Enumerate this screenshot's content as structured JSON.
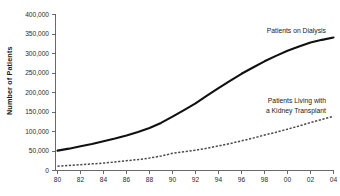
{
  "chart_data": {
    "type": "line",
    "title": "",
    "xlabel": "",
    "ylabel": "Number of Patients",
    "xlim": [
      1980,
      2004
    ],
    "ylim": [
      0,
      400000
    ],
    "grid": false,
    "legend_position": "inline-annotation",
    "x": [
      1980,
      1981,
      1982,
      1983,
      1984,
      1985,
      1986,
      1987,
      1988,
      1989,
      1990,
      1991,
      1992,
      1993,
      1994,
      1995,
      1996,
      1997,
      1998,
      1999,
      2000,
      2001,
      2002,
      2003,
      2004
    ],
    "x_tick_labels": [
      "80",
      "82",
      "84",
      "86",
      "88",
      "90",
      "92",
      "94",
      "96",
      "98",
      "00",
      "02",
      "04"
    ],
    "x_tick_values": [
      1980,
      1982,
      1984,
      1986,
      1988,
      1990,
      1992,
      1994,
      1996,
      1998,
      2000,
      2002,
      2004
    ],
    "y_tick_labels": [
      "0",
      "50,000",
      "100,000",
      "150,000",
      "200,000",
      "250,000",
      "300,000",
      "350,000",
      "400,000"
    ],
    "y_tick_values": [
      0,
      50000,
      100000,
      150000,
      200000,
      250000,
      300000,
      350000,
      400000
    ],
    "series": [
      {
        "name": "Patients on Dialysis",
        "style": "solid",
        "color": "#111111",
        "values": [
          51000,
          56000,
          62000,
          68000,
          75000,
          82000,
          90000,
          99000,
          109000,
          122000,
          138000,
          155000,
          172000,
          192000,
          211000,
          230000,
          248000,
          264000,
          280000,
          294000,
          307000,
          318000,
          328000,
          335000,
          341000
        ]
      },
      {
        "name": "Patients Living with a Kidney Transplant",
        "style": "dashed",
        "color": "#4a4a4a",
        "values": [
          11000,
          13000,
          15000,
          17000,
          19000,
          22000,
          25000,
          28000,
          32000,
          37000,
          44000,
          48000,
          52000,
          57000,
          63000,
          69000,
          76000,
          83000,
          91000,
          98000,
          106000,
          114000,
          123000,
          131000,
          139000
        ]
      }
    ],
    "annotations": [
      {
        "id": "dialysis",
        "text": "Patients on Dialysis"
      },
      {
        "id": "transplant_line1",
        "text": "Patients Living with"
      },
      {
        "id": "transplant_line2",
        "text": "a Kidney Transplant"
      }
    ]
  }
}
